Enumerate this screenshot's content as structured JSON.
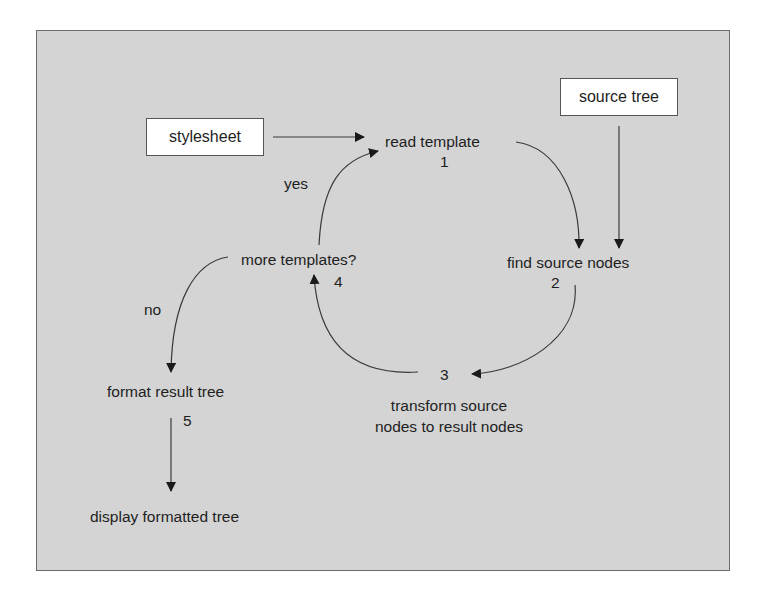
{
  "diagram": {
    "title": "",
    "colors": {
      "background": "#d4d4d4",
      "border": "#6b6b6b",
      "box_fill": "#ffffff",
      "line": "#3a3a3a",
      "text": "#1e1e1e"
    },
    "inputs": {
      "stylesheet": "stylesheet",
      "source_tree": "source tree"
    },
    "steps": [
      {
        "number": "1",
        "label": "read template"
      },
      {
        "number": "2",
        "label": "find source nodes"
      },
      {
        "number": "3",
        "label_line1": "transform source",
        "label_line2": "nodes to result nodes"
      },
      {
        "number": "4",
        "label": "more templates?"
      },
      {
        "number": "5",
        "label": "format result tree"
      }
    ],
    "output": "display formatted tree",
    "edge_labels": {
      "yes": "yes",
      "no": "no"
    },
    "edges": [
      {
        "from": "stylesheet",
        "to": "read template"
      },
      {
        "from": "source tree",
        "to": "find source nodes"
      },
      {
        "from": "read template",
        "to": "find source nodes"
      },
      {
        "from": "find source nodes",
        "to": "transform source nodes to result nodes"
      },
      {
        "from": "transform source nodes to result nodes",
        "to": "more templates?"
      },
      {
        "from": "more templates?",
        "to": "read template",
        "label": "yes"
      },
      {
        "from": "more templates?",
        "to": "format result tree",
        "label": "no"
      },
      {
        "from": "format result tree",
        "to": "display formatted tree"
      }
    ]
  }
}
